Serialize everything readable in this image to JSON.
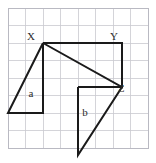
{
  "figure": {
    "background_color": "#ffffff",
    "stroke_color": "#1a1a1a",
    "grid_color": "#c9c9cf",
    "grid_border_color": "#b9b9c2",
    "label_color": "#2b2b2b"
  },
  "grid": {
    "origin_x": 8,
    "origin_y": 8,
    "cell_size": 17.5,
    "cols": 8,
    "rows": 8,
    "width": 140,
    "height": 140,
    "visible": true
  },
  "labels": {
    "vertex_x": "X",
    "vertex_y": "Y",
    "vertex_z": "Z",
    "region_a": "a",
    "region_b": "b"
  },
  "label_positions": {
    "vertex_x": {
      "x": 31,
      "y": 40
    },
    "vertex_y": {
      "x": 114,
      "y": 40
    },
    "vertex_z": {
      "x": 121,
      "y": 92
    },
    "region_a": {
      "x": 31,
      "y": 97
    },
    "region_b": {
      "x": 85,
      "y": 116
    }
  },
  "points": {
    "X": {
      "x": 43,
      "y": 43
    },
    "Y": {
      "x": 122,
      "y": 43
    },
    "Z": {
      "x": 122,
      "y": 87
    },
    "a_top": {
      "x": 43,
      "y": 43
    },
    "a_bottom_right": {
      "x": 43,
      "y": 113
    },
    "a_bottom_left": {
      "x": 8,
      "y": 113
    },
    "b_top_left": {
      "x": 78,
      "y": 87
    },
    "b_bottom": {
      "x": 78,
      "y": 155
    },
    "b_right": {
      "x": 122,
      "y": 87
    }
  },
  "shapes": [
    {
      "name": "triangle-xyz",
      "points": "43,43 122,43 122,87 43,43",
      "description": "Right triangle with vertices X, Y, Z"
    },
    {
      "name": "triangle-a",
      "points": "43,43 43,113 8,113 43,43",
      "description": "Triangle labelled a on the left"
    },
    {
      "name": "triangle-b",
      "points": "78,87 122,87 78,155 78,87",
      "description": "Triangle labelled b below, sharing vertex Z"
    }
  ]
}
